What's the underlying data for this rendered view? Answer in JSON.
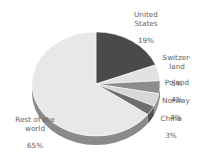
{
  "chart_data": {
    "type": "pie",
    "title": "",
    "subtitle": "",
    "xlabel": "",
    "ylabel": "",
    "legend_position": "none",
    "grid": false,
    "three_d": true,
    "start_angle_deg": 0,
    "direction": "clockwise",
    "categories": [
      "United States",
      "Switzerland",
      "Poland",
      "Norway",
      "China",
      "Rest of the world"
    ],
    "values": [
      19,
      5,
      4,
      4,
      3,
      65
    ],
    "value_unit": "%",
    "colors": [
      "#4a4a4a",
      "#e2e2e2",
      "#8c8c8c",
      "#d6d6d6",
      "#6e6e6e",
      "#e8e8e8"
    ],
    "side_color": "#8a8a8a",
    "background": "#ffffff",
    "text_color": "#5d5d5d",
    "slices": [
      {
        "name": "United States",
        "display_name": "United\nStates",
        "value": 19,
        "value_label": "19%",
        "color": "#4a4a4a",
        "side_color": "#3a3a3a"
      },
      {
        "name": "Switzerland",
        "display_name": "Switzer-\nland",
        "value": 5,
        "value_label": "5%",
        "color": "#e2e2e2",
        "side_color": "#9b9b9b"
      },
      {
        "name": "Poland",
        "display_name": "Poland",
        "value": 4,
        "value_label": "4%",
        "color": "#8c8c8c",
        "side_color": "#6b6b6b"
      },
      {
        "name": "Norway",
        "display_name": "Norway",
        "value": 4,
        "value_label": "4%",
        "color": "#d6d6d6",
        "side_color": "#949494"
      },
      {
        "name": "China",
        "display_name": "China",
        "value": 3,
        "value_label": "3%",
        "color": "#6e6e6e",
        "side_color": "#535353"
      },
      {
        "name": "Rest of the world",
        "display_name": "Rest of the\nworld",
        "value": 65,
        "value_label": "65%",
        "color": "#e8e8e8",
        "side_color": "#8a8a8a"
      }
    ]
  },
  "labels": {
    "united_states": {
      "name": "United\nStates",
      "pct": "19%"
    },
    "switzerland": {
      "name": "Switzer-\nland",
      "pct": "5%"
    },
    "poland": {
      "name": "Poland",
      "pct": "4%"
    },
    "norway": {
      "name": "Norway",
      "pct": "4%"
    },
    "china": {
      "name": "China",
      "pct": "3%"
    },
    "rest": {
      "name": "Rest of the\nworld",
      "pct": "65%"
    }
  }
}
